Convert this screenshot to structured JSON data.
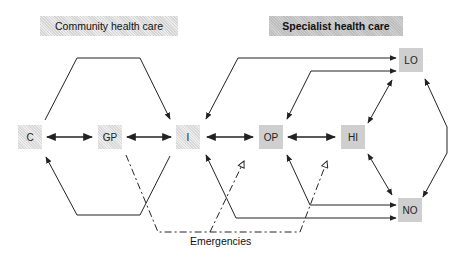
{
  "headers": {
    "community": "Community health care",
    "specialist": "Specialist health care"
  },
  "nodes": {
    "C": "C",
    "GP": "GP",
    "I": "I",
    "OP": "OP",
    "HI": "HI",
    "LO": "LO",
    "NO": "NO"
  },
  "caption": "Emergencies",
  "colors": {
    "line": "#222222",
    "community_fill": "#e4e4e4",
    "specialist_fill": "#c8c8c8"
  }
}
